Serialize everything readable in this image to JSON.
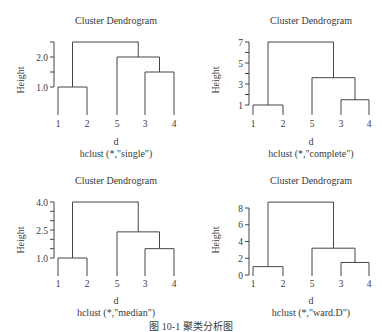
{
  "caption": "图 10-1  聚类分析图",
  "chart_data": [
    {
      "type": "dendrogram",
      "title": "Cluster Dendrogram",
      "xlabel": "d",
      "sublabel": "hclust (*,\"single\")",
      "ylabel": "Height",
      "leaf_order": [
        "1",
        "2",
        "5",
        "3",
        "4"
      ],
      "yticks": [
        1.0,
        1.5,
        2.0,
        2.5
      ],
      "ytick_labels": [
        "1.0",
        "",
        "2.0",
        ""
      ],
      "ylim": [
        1.0,
        2.5
      ],
      "merges": [
        {
          "members": [
            "1",
            "2"
          ],
          "height": 1.0
        },
        {
          "members": [
            "3",
            "4"
          ],
          "height": 1.5
        },
        {
          "members": [
            "5",
            "(3,4)"
          ],
          "height": 2.0
        },
        {
          "members": [
            "(1,2)",
            "(5,3,4)"
          ],
          "height": 2.5
        }
      ]
    },
    {
      "type": "dendrogram",
      "title": "Cluster Dendrogram",
      "xlabel": "d",
      "sublabel": "hclust (*,\"complete\")",
      "ylabel": "Height",
      "leaf_order": [
        "1",
        "2",
        "5",
        "3",
        "4"
      ],
      "yticks": [
        1,
        2,
        3,
        4,
        5,
        6,
        7
      ],
      "ytick_labels": [
        "1",
        "",
        "3",
        "",
        "5",
        "",
        "7"
      ],
      "ylim": [
        1,
        7
      ],
      "merges": [
        {
          "members": [
            "1",
            "2"
          ],
          "height": 1.0
        },
        {
          "members": [
            "3",
            "4"
          ],
          "height": 1.5
        },
        {
          "members": [
            "5",
            "(3,4)"
          ],
          "height": 3.6
        },
        {
          "members": [
            "(1,2)",
            "(5,3,4)"
          ],
          "height": 7.0
        }
      ]
    },
    {
      "type": "dendrogram",
      "title": "Cluster Dendrogram",
      "xlabel": "d",
      "sublabel": "hclust (*,\"median\")",
      "ylabel": "Height",
      "leaf_order": [
        "1",
        "2",
        "5",
        "3",
        "4"
      ],
      "yticks": [
        1.0,
        1.5,
        2.0,
        2.5,
        3.0,
        3.5,
        4.0
      ],
      "ytick_labels": [
        "1.0",
        "",
        "",
        "2.5",
        "",
        "",
        "4.0"
      ],
      "ylim": [
        1.0,
        4.0
      ],
      "merges": [
        {
          "members": [
            "1",
            "2"
          ],
          "height": 1.0
        },
        {
          "members": [
            "3",
            "4"
          ],
          "height": 1.5
        },
        {
          "members": [
            "5",
            "(3,4)"
          ],
          "height": 2.4
        },
        {
          "members": [
            "(1,2)",
            "(5,3,4)"
          ],
          "height": 4.0
        }
      ]
    },
    {
      "type": "dendrogram",
      "title": "Cluster Dendrogram",
      "xlabel": "d",
      "sublabel": "hclust (*,\"ward.D\")",
      "ylabel": "Height",
      "leaf_order": [
        "1",
        "2",
        "5",
        "3",
        "4"
      ],
      "yticks": [
        0,
        2,
        4,
        6,
        8
      ],
      "ytick_labels": [
        "0",
        "2",
        "4",
        "6",
        "8"
      ],
      "ylim": [
        0,
        8.7
      ],
      "merges": [
        {
          "members": [
            "1",
            "2"
          ],
          "height": 1.0
        },
        {
          "members": [
            "3",
            "4"
          ],
          "height": 1.5
        },
        {
          "members": [
            "5",
            "(3,4)"
          ],
          "height": 3.2
        },
        {
          "members": [
            "(1,2)",
            "(5,3,4)"
          ],
          "height": 8.7
        }
      ]
    }
  ]
}
